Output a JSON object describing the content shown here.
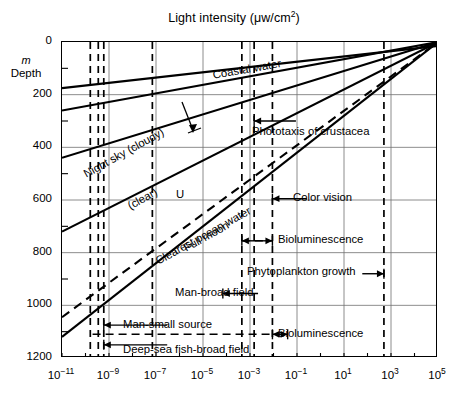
{
  "chart_data": {
    "type": "line",
    "title": "Light intensity (μw/cm2)",
    "title_parts": {
      "main": "Light intensity (μw/cm",
      "sup": "2",
      "tail": ")"
    },
    "xlabel": "",
    "ylabel": "Depth",
    "ylabel_unit": "m",
    "xscale": "log",
    "xlim": [
      1e-11,
      100000.0
    ],
    "ylim": [
      1200,
      0
    ],
    "y_inverted": true,
    "grid": true,
    "legend": "none",
    "xticks": [
      {
        "value": 1e-11,
        "label": "10",
        "exp": "−11"
      },
      {
        "value": 1e-09,
        "label": "10",
        "exp": "−9"
      },
      {
        "value": 1e-07,
        "label": "10",
        "exp": "−7"
      },
      {
        "value": 1e-05,
        "label": "10",
        "exp": "−5"
      },
      {
        "value": 0.001,
        "label": "10",
        "exp": "−3"
      },
      {
        "value": 0.1,
        "label": "10",
        "exp": "−1"
      },
      {
        "value": 10.0,
        "label": "10",
        "exp": "1"
      },
      {
        "value": 1000.0,
        "label": "10",
        "exp": "3"
      },
      {
        "value": 100000.0,
        "label": "10",
        "exp": "5"
      }
    ],
    "xtick_minor_decades": [
      -10,
      -8,
      -6,
      -4,
      -2,
      0,
      2,
      4
    ],
    "yticks": [
      0,
      200,
      400,
      600,
      800,
      1000,
      1200
    ],
    "ytick_minor": [
      100,
      300,
      500,
      700,
      900,
      1100
    ],
    "series": [
      {
        "name": "Night sky (cloudy)",
        "style": "solid",
        "label": "Night sky (cloudy)",
        "points": [
          [
            1e-11,
            260
          ],
          [
            100000.0,
            0
          ]
        ]
      },
      {
        "name": "Night sky (clear)",
        "style": "solid",
        "label": "(clear)",
        "points": [
          [
            1e-11,
            440
          ],
          [
            100000.0,
            0
          ]
        ]
      },
      {
        "name": "Full moon",
        "style": "solid",
        "label": "Full moon",
        "points": [
          [
            1e-11,
            720
          ],
          [
            100000.0,
            0
          ]
        ]
      },
      {
        "name": "Clearest ocean water",
        "style": "dashed",
        "label": "Clearest ocean water",
        "points": [
          [
            1e-11,
            1045
          ],
          [
            100000.0,
            0
          ]
        ]
      },
      {
        "name": "Coastal water",
        "style": "solid",
        "label": "Coastal water",
        "points": [
          [
            1e-11,
            1120
          ],
          [
            100000.0,
            0
          ]
        ]
      },
      {
        "name": "Coastal water upper",
        "style": "solid",
        "label": "",
        "points": [
          [
            1e-11,
            175
          ],
          [
            100000.0,
            15
          ]
        ]
      }
    ],
    "annotations": [
      {
        "text": "Phototaxis of crustacea",
        "arrow": "left",
        "y_depth": 300
      },
      {
        "text": "Color vision",
        "arrow": "left",
        "y_depth": 595
      },
      {
        "text": "Bioluminescence",
        "arrow": "both",
        "y_depth": 755
      },
      {
        "text": "Phytoplankton growth",
        "arrow": "right",
        "y_depth": 880
      },
      {
        "text": "Man-broad field",
        "arrow": "left",
        "y_depth": 955
      },
      {
        "text": "Man-small source",
        "arrow": "left",
        "y_depth": 1075
      },
      {
        "text": "Bioluminescence",
        "arrow": "both",
        "y_depth": 1110
      },
      {
        "text": "Deep-sea fish-broad field",
        "arrow": "left",
        "y_depth": 1150
      },
      {
        "text": "U",
        "arrow": "leader",
        "y_depth": 580
      }
    ],
    "vertical_threshold_lines": [
      1.6e-10,
      3.5e-10,
      6e-10,
      7e-08,
      0.0015,
      0.009,
      0.00045,
      500.0
    ],
    "colors": {
      "ink": "#000000",
      "grid": "#666666",
      "background": "#ffffff"
    }
  },
  "title": {
    "main": "Light intensity (μw/cm",
    "sup": "2",
    "tail": ")"
  },
  "axes": {
    "y_unit": "m",
    "y_name": "Depth",
    "y_labels": [
      "0",
      "200",
      "400",
      "600",
      "800",
      "1000",
      "1200"
    ],
    "x_mantissa": "10",
    "x_exponents": [
      "−11",
      "−9",
      "−7",
      "−5",
      "−3",
      "−1",
      "1",
      "3",
      "5"
    ]
  },
  "curve_labels": {
    "night_sky_cloudy": "Night sky (cloudy)",
    "night_sky_clear": "(clear)",
    "full_moon": "Full moon",
    "coastal_water": "Coastal water",
    "clearest_ocean_water": "Clearest ocean water",
    "u_marker": "U"
  },
  "annotations": {
    "phototaxis": "Phototaxis of crustacea",
    "color_vision": "Color vision",
    "bioluminescence_upper": "Bioluminescence",
    "phytoplankton": "Phytoplankton growth",
    "man_broad_field": "Man-broad field",
    "man_small_source": "Man-small source",
    "bioluminescence_lower": "Bioluminescence",
    "deep_sea_fish": "Deep-sea fish-broad field"
  }
}
